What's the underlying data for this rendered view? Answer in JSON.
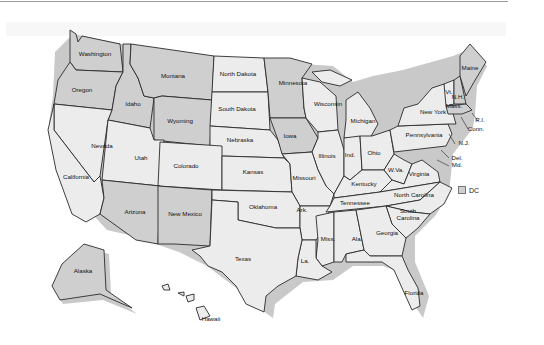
{
  "map": {
    "title": "",
    "colors": {
      "light": "#ececec",
      "dark": "#cfcfcf",
      "border": "#2a2a2a",
      "shadow": "#c9c9c9",
      "water": "#ffffff"
    },
    "legend": {
      "label": "DC",
      "swatch_color": "#cfcfcf"
    },
    "states": [
      {
        "id": "washington",
        "label": "Washington",
        "shade": "dark",
        "lx": 95,
        "ly": 56
      },
      {
        "id": "oregon",
        "label": "Oregon",
        "shade": "dark",
        "lx": 82,
        "ly": 92
      },
      {
        "id": "idaho",
        "label": "Idaho",
        "shade": "dark",
        "lx": 133,
        "ly": 106
      },
      {
        "id": "montana",
        "label": "Montana",
        "shade": "dark",
        "lx": 173,
        "ly": 78
      },
      {
        "id": "wyoming",
        "label": "Wyoming",
        "shade": "dark",
        "lx": 180,
        "ly": 123
      },
      {
        "id": "north-dakota",
        "label": "North Dakota",
        "shade": "light",
        "lx": 238,
        "ly": 76
      },
      {
        "id": "south-dakota",
        "label": "South Dakota",
        "shade": "light",
        "lx": 237,
        "ly": 111
      },
      {
        "id": "nebraska",
        "label": "Nebraska",
        "shade": "light",
        "lx": 240,
        "ly": 142
      },
      {
        "id": "minnesota",
        "label": "Minnesota",
        "shade": "dark",
        "lx": 293,
        "ly": 85
      },
      {
        "id": "iowa",
        "label": "Iowa",
        "shade": "dark",
        "lx": 290,
        "ly": 138
      },
      {
        "id": "wisconsin",
        "label": "Wisconsin",
        "shade": "light",
        "lx": 328,
        "ly": 106
      },
      {
        "id": "michigan",
        "label": "Michigan",
        "shade": "light",
        "lx": 363,
        "ly": 123
      },
      {
        "id": "illinois",
        "label": "Illinois",
        "shade": "light",
        "lx": 327,
        "ly": 158
      },
      {
        "id": "indiana",
        "label": "Ind.",
        "shade": "light",
        "lx": 350,
        "ly": 157
      },
      {
        "id": "ohio",
        "label": "Ohio",
        "shade": "light",
        "lx": 374,
        "ly": 155
      },
      {
        "id": "nevada",
        "label": "Nevada",
        "shade": "light",
        "lx": 102,
        "ly": 148
      },
      {
        "id": "utah",
        "label": "Utah",
        "shade": "light",
        "lx": 141,
        "ly": 160
      },
      {
        "id": "colorado",
        "label": "Colorado",
        "shade": "light",
        "lx": 186,
        "ly": 168
      },
      {
        "id": "kansas",
        "label": "Kansas",
        "shade": "light",
        "lx": 253,
        "ly": 174
      },
      {
        "id": "missouri",
        "label": "Missouri",
        "shade": "light",
        "lx": 304,
        "ly": 180
      },
      {
        "id": "kentucky",
        "label": "Kentucky",
        "shade": "light",
        "lx": 364,
        "ly": 186
      },
      {
        "id": "west-virginia",
        "label": "W.Va.",
        "shade": "light",
        "lx": 396,
        "ly": 172
      },
      {
        "id": "virginia",
        "label": "Virginia",
        "shade": "light",
        "lx": 419,
        "ly": 176
      },
      {
        "id": "california",
        "label": "California",
        "shade": "light",
        "lx": 76,
        "ly": 179
      },
      {
        "id": "arizona",
        "label": "Arizona",
        "shade": "dark",
        "lx": 135,
        "ly": 214
      },
      {
        "id": "new-mexico",
        "label": "New Mexico",
        "shade": "dark",
        "lx": 185,
        "ly": 216
      },
      {
        "id": "oklahoma",
        "label": "Oklahoma",
        "shade": "light",
        "lx": 263,
        "ly": 209
      },
      {
        "id": "arkansas",
        "label": "Ark.",
        "shade": "light",
        "lx": 302,
        "ly": 212
      },
      {
        "id": "tennessee",
        "label": "Tennessee",
        "shade": "light",
        "lx": 355,
        "ly": 205
      },
      {
        "id": "north-carolina",
        "label": "North Carolina",
        "shade": "light",
        "lx": 414,
        "ly": 197
      },
      {
        "id": "south-carolina",
        "label": "South Carolina",
        "shade": "light",
        "lx": 408,
        "ly": 216
      },
      {
        "id": "mississippi",
        "label": "Miss.",
        "shade": "light",
        "lx": 328,
        "ly": 241
      },
      {
        "id": "alabama",
        "label": "Ala.",
        "shade": "light",
        "lx": 357,
        "ly": 241
      },
      {
        "id": "georgia",
        "label": "Georgia",
        "shade": "light",
        "lx": 387,
        "ly": 235
      },
      {
        "id": "louisiana",
        "label": "La.",
        "shade": "light",
        "lx": 305,
        "ly": 263
      },
      {
        "id": "texas",
        "label": "Texas",
        "shade": "light",
        "lx": 243,
        "ly": 261
      },
      {
        "id": "florida",
        "label": "Florida",
        "shade": "light",
        "lx": 414,
        "ly": 295
      },
      {
        "id": "pennsylvania",
        "label": "Pennsylvania",
        "shade": "light",
        "lx": 424,
        "ly": 137
      },
      {
        "id": "new-york",
        "label": "New York",
        "shade": "light",
        "lx": 433,
        "ly": 114
      },
      {
        "id": "vermont",
        "label": "Vt.",
        "shade": "light",
        "lx": 449,
        "ly": 94
      },
      {
        "id": "new-hampshire",
        "label": "N.H.",
        "shade": "dark",
        "lx": 458,
        "ly": 99
      },
      {
        "id": "maine",
        "label": "Maine",
        "shade": "dark",
        "lx": 470,
        "ly": 70
      },
      {
        "id": "massachusetts",
        "label": "Mass.",
        "shade": "dark",
        "lx": 454,
        "ly": 108
      },
      {
        "id": "alaska",
        "label": "Alaska",
        "shade": "dark",
        "lx": 83,
        "ly": 273
      },
      {
        "id": "hawaii",
        "label": "Hawaii",
        "shade": "light",
        "lx": 211,
        "ly": 321
      }
    ],
    "callouts": [
      {
        "id": "rhode-island",
        "label": "R.I.",
        "x1": 472,
        "y1": 113,
        "x2": 478,
        "y2": 121,
        "lx": 480,
        "ly": 122
      },
      {
        "id": "connecticut",
        "label": "Conn.",
        "x1": 461,
        "y1": 117,
        "x2": 468,
        "y2": 129,
        "lx": 476,
        "ly": 131
      },
      {
        "id": "new-jersey",
        "label": "N.J.",
        "x1": 449,
        "y1": 134,
        "x2": 455,
        "y2": 144,
        "lx": 464,
        "ly": 145
      },
      {
        "id": "delaware",
        "label": "Del.",
        "x1": 441,
        "y1": 150,
        "x2": 449,
        "y2": 158,
        "lx": 457,
        "ly": 160
      },
      {
        "id": "maryland",
        "label": "Md.",
        "x1": 437,
        "y1": 160,
        "x2": 449,
        "y2": 166,
        "lx": 457,
        "ly": 167
      }
    ]
  }
}
